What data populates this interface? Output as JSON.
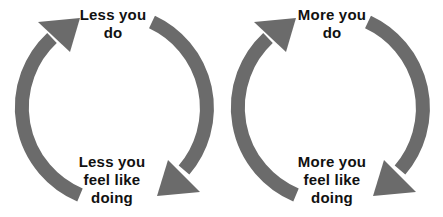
{
  "colors": {
    "arrow": "#6b6b6b",
    "text": "#111111",
    "background": "#ffffff"
  },
  "cycles": [
    {
      "name": "vicious-cycle",
      "top_label": [
        "Less you",
        "do"
      ],
      "bottom_label": [
        "Less you",
        "feel like",
        "doing"
      ]
    },
    {
      "name": "virtuous-cycle",
      "top_label": [
        "More you",
        "do"
      ],
      "bottom_label": [
        "More you",
        "feel like",
        "doing"
      ]
    }
  ]
}
